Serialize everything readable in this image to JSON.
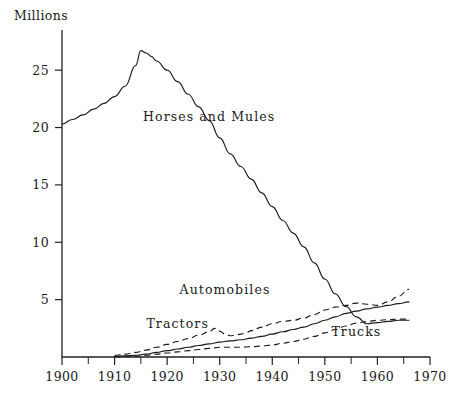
{
  "chart_data": {
    "type": "line",
    "title": "",
    "ylabel": "Millions",
    "xlabel": "",
    "xlim": [
      1900,
      1970
    ],
    "ylim": [
      0,
      28.5
    ],
    "grid": false,
    "legend_position": "inline-annotations",
    "y_ticks": [
      "5",
      "10",
      "15",
      "20",
      "25"
    ],
    "y_tick_values": [
      5,
      10,
      15,
      20,
      25
    ],
    "x_ticks": [
      "1900",
      "1910",
      "1920",
      "1930",
      "1940",
      "1950",
      "1960",
      "1970"
    ],
    "x_tick_values": [
      1900,
      1910,
      1920,
      1930,
      1940,
      1950,
      1960,
      1970
    ],
    "x_minor_ticks": [
      1905,
      1915,
      1925,
      1935,
      1945,
      1955,
      1965
    ],
    "series": [
      {
        "name": "Horses and Mules",
        "style": "solid",
        "label": "Horses and Mules",
        "label_x": 1928,
        "label_y": 20.6,
        "x": [
          1900,
          1902,
          1904,
          1906,
          1908,
          1910,
          1912,
          1914,
          1915,
          1916,
          1917,
          1918,
          1920,
          1922,
          1924,
          1926,
          1928,
          1930,
          1932,
          1934,
          1936,
          1938,
          1940,
          1942,
          1944,
          1946,
          1948,
          1950,
          1952,
          1954,
          1956,
          1958,
          1960,
          1962,
          1964,
          1966
        ],
        "values": [
          20.3,
          20.7,
          21.1,
          21.6,
          22.1,
          22.7,
          23.6,
          25.4,
          26.7,
          26.5,
          26.2,
          25.8,
          25.0,
          24.0,
          22.9,
          21.8,
          20.6,
          19.1,
          17.7,
          16.6,
          15.5,
          14.3,
          13.1,
          11.9,
          10.8,
          9.6,
          8.2,
          6.8,
          5.5,
          4.4,
          3.5,
          2.9,
          3.0,
          3.1,
          3.2,
          3.2
        ]
      },
      {
        "name": "Automobiles",
        "style": "dashed",
        "label": "Automobiles",
        "label_x": 1931,
        "label_y": 5.5,
        "x": [
          1910,
          1912,
          1914,
          1916,
          1918,
          1920,
          1922,
          1924,
          1926,
          1928,
          1929,
          1930,
          1931,
          1932,
          1933,
          1934,
          1935,
          1936,
          1938,
          1940,
          1942,
          1944,
          1946,
          1948,
          1950,
          1952,
          1954,
          1956,
          1958,
          1960,
          1962,
          1964,
          1966
        ],
        "values": [
          0.15,
          0.25,
          0.4,
          0.6,
          0.85,
          1.1,
          1.35,
          1.6,
          1.9,
          2.2,
          2.5,
          2.25,
          2.0,
          1.85,
          1.9,
          2.0,
          2.1,
          2.3,
          2.6,
          2.9,
          3.1,
          3.2,
          3.4,
          3.7,
          4.1,
          4.35,
          4.5,
          4.7,
          4.6,
          4.5,
          4.8,
          5.3,
          5.9
        ]
      },
      {
        "name": "Tractors",
        "style": "solid",
        "label": "Tractors",
        "label_x": 1922,
        "label_y": 2.5,
        "x": [
          1910,
          1912,
          1914,
          1916,
          1918,
          1920,
          1922,
          1924,
          1926,
          1928,
          1930,
          1932,
          1934,
          1936,
          1938,
          1940,
          1942,
          1944,
          1946,
          1948,
          1950,
          1952,
          1954,
          1956,
          1958,
          1960,
          1962,
          1964,
          1966
        ],
        "values": [
          0.05,
          0.1,
          0.15,
          0.25,
          0.4,
          0.55,
          0.7,
          0.85,
          1.0,
          1.15,
          1.3,
          1.4,
          1.5,
          1.65,
          1.8,
          2.0,
          2.2,
          2.4,
          2.6,
          2.9,
          3.2,
          3.5,
          3.8,
          4.0,
          4.2,
          4.35,
          4.5,
          4.65,
          4.8
        ]
      },
      {
        "name": "Trucks",
        "style": "dashed",
        "label": "Trucks",
        "label_x": 1956,
        "label_y": 1.85,
        "x": [
          1910,
          1912,
          1914,
          1916,
          1918,
          1920,
          1922,
          1924,
          1926,
          1928,
          1930,
          1932,
          1934,
          1936,
          1938,
          1940,
          1942,
          1944,
          1946,
          1948,
          1950,
          1952,
          1954,
          1956,
          1958,
          1960,
          1962,
          1964,
          1966
        ],
        "values": [
          0.02,
          0.05,
          0.08,
          0.15,
          0.25,
          0.35,
          0.45,
          0.55,
          0.65,
          0.75,
          0.85,
          0.85,
          0.85,
          0.9,
          0.95,
          1.05,
          1.2,
          1.35,
          1.55,
          1.8,
          2.1,
          2.4,
          2.7,
          2.95,
          3.1,
          3.2,
          3.25,
          3.3,
          3.3
        ]
      }
    ]
  }
}
